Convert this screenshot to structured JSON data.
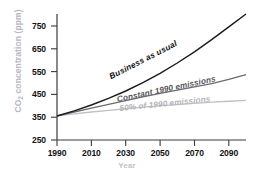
{
  "chart_data": {
    "type": "line",
    "title": "",
    "xlabel": "Year",
    "ylabel": "CO2 concentration (ppm)",
    "ylabel_prefix": "CO",
    "ylabel_sub": "2",
    "ylabel_suffix": " concentration (ppm)",
    "xlim": [
      1990,
      2100
    ],
    "ylim": [
      250,
      790
    ],
    "grid": false,
    "legend": "inline-curve-labels",
    "xticks": [
      "1990",
      "2010",
      "2030",
      "2050",
      "2070",
      "2090"
    ],
    "xtick_values": [
      1990,
      2010,
      2030,
      2050,
      2070,
      2090
    ],
    "yticks": [
      "250",
      "350",
      "450",
      "550",
      "650",
      "750"
    ],
    "ytick_values": [
      250,
      350,
      450,
      550,
      650,
      750
    ],
    "x": [
      1990,
      2000,
      2010,
      2020,
      2030,
      2040,
      2050,
      2060,
      2070,
      2080,
      2090,
      2100
    ],
    "series": [
      {
        "name": "Business as usual",
        "color": "#1a1a1a",
        "values": [
          353,
          375,
          400,
          428,
          460,
          496,
          536,
          580,
          628,
          680,
          735,
          790
        ]
      },
      {
        "name": "Constant 1990 emissions",
        "color": "#6b6b70",
        "values": [
          353,
          370,
          387,
          403,
          419,
          435,
          450,
          464,
          478,
          492,
          510,
          530
        ]
      },
      {
        "name": "50% of 1990 emissions",
        "color": "#c0c0c5",
        "values": [
          353,
          362,
          370,
          377,
          384,
          391,
          397,
          402,
          407,
          412,
          416,
          420
        ]
      }
    ],
    "axis_color": "#3a3a3a",
    "background": "#ffffff"
  }
}
